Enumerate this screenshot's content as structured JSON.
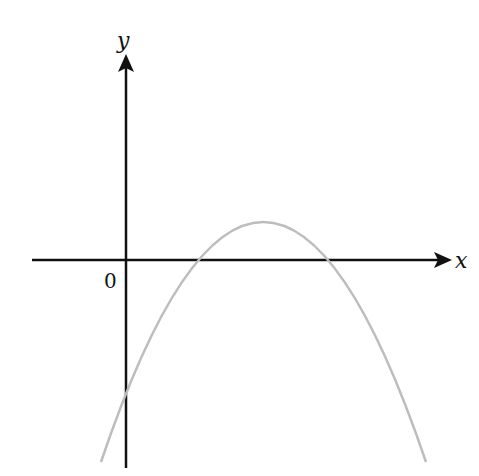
{
  "diagram": {
    "type": "graph-sketch",
    "axes": {
      "x_label": "x",
      "y_label": "y",
      "origin_label": "0"
    },
    "colors": {
      "axes": "#111111",
      "curve": "#bdbdbd"
    },
    "curve": {
      "kind": "parabola",
      "opens": "down",
      "features": [
        "y-intercept below the x-axis",
        "two positive x-intercepts",
        "vertex above the x-axis at positive x"
      ]
    }
  }
}
